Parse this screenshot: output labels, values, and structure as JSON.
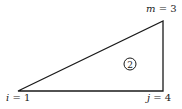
{
  "diagram": {
    "type": "triangle-element",
    "element_number": "2",
    "nodes": [
      {
        "id": "i",
        "label_var": "i",
        "label_value": "1",
        "text": "i = 1",
        "position": "bottom-left"
      },
      {
        "id": "j",
        "label_var": "j",
        "label_value": "4",
        "text": "j = 4",
        "position": "bottom-right"
      },
      {
        "id": "m",
        "label_var": "m",
        "label_value": "3",
        "text": "m = 3",
        "position": "top-right"
      }
    ],
    "colors": {
      "stroke": "#1a1a1a",
      "background": "#ffffff"
    }
  }
}
